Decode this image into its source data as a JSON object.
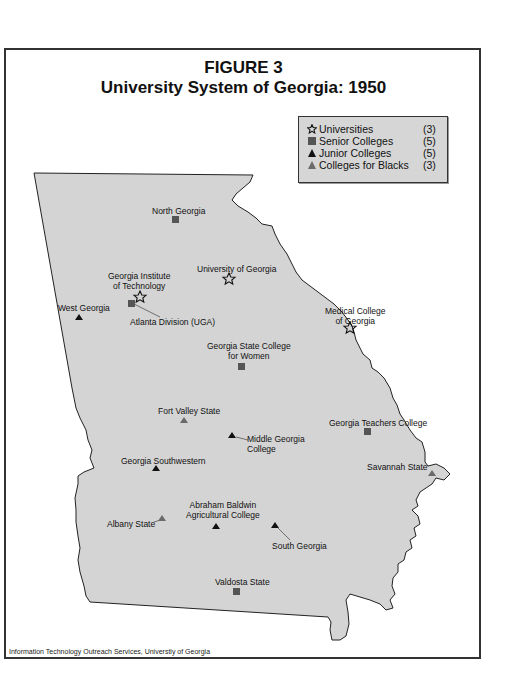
{
  "figure": {
    "label": "FIGURE 3",
    "title": "University System of Georgia: 1950"
  },
  "legend": {
    "items": [
      {
        "symbol": "star-outline",
        "label": "Universities",
        "count": "(3)",
        "color": "#111111"
      },
      {
        "symbol": "square",
        "label": "Senior Colleges",
        "count": "(5)",
        "color": "#555555"
      },
      {
        "symbol": "triangle",
        "label": "Junior Colleges",
        "count": "(5)",
        "color": "#111111"
      },
      {
        "symbol": "triangle",
        "label": "Colleges for Blacks",
        "count": "(3)",
        "color": "#6a6a6a"
      }
    ]
  },
  "places": [
    {
      "name": "North Georgia",
      "type": "Senior College",
      "symbol": "square"
    },
    {
      "name": "University of Georgia",
      "type": "University",
      "symbol": "star-outline"
    },
    {
      "name_line1": "Georgia Institute",
      "name_line2": "of Technology",
      "type": "University",
      "symbol": "star-outline"
    },
    {
      "name": "Atlanta Division (UGA)",
      "type": "Senior College",
      "symbol": "square"
    },
    {
      "name": "West Georgia",
      "type": "Junior College",
      "symbol": "triangle"
    },
    {
      "name_line1": "Medical College",
      "name_line2": "of Georgia",
      "type": "University",
      "symbol": "star-outline"
    },
    {
      "name_line1": "Georgia State College",
      "name_line2": "for Women",
      "type": "Senior College",
      "symbol": "square"
    },
    {
      "name": "Fort Valley State",
      "type": "College for Blacks",
      "symbol": "triangle"
    },
    {
      "name_line1": "Middle Georgia",
      "name_line2": "College",
      "type": "Junior College",
      "symbol": "triangle"
    },
    {
      "name": "Georgia Teachers College",
      "type": "Senior College",
      "symbol": "square"
    },
    {
      "name": "Georgia Southwestern",
      "type": "Junior College",
      "symbol": "triangle"
    },
    {
      "name": "Savannah State",
      "type": "College for Blacks",
      "symbol": "triangle"
    },
    {
      "name_line1": "Abraham Baldwin",
      "name_line2": "Agricultural College",
      "type": "Junior College",
      "symbol": "triangle"
    },
    {
      "name": "Albany State",
      "type": "College for Blacks",
      "symbol": "triangle"
    },
    {
      "name": "South Georgia",
      "type": "Junior College",
      "symbol": "triangle"
    },
    {
      "name": "Valdosta State",
      "type": "Senior College",
      "symbol": "square"
    }
  ],
  "credit": "Information Technology Outreach Services, Universtiy of Georgia",
  "colors": {
    "state_fill": "#d4d4d4",
    "outline": "#222222",
    "legend_bg": "#d6d6d6"
  }
}
